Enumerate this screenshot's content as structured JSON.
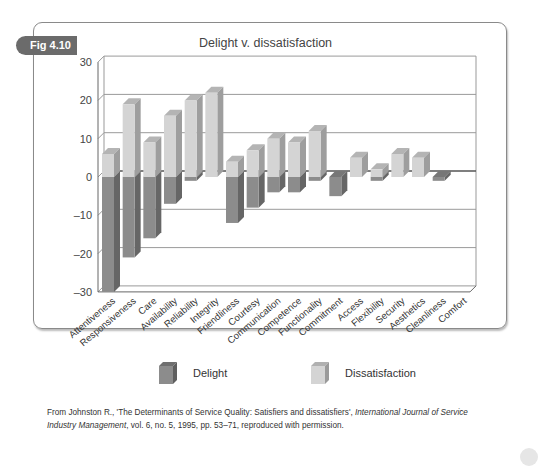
{
  "figure": {
    "tag": "Fig 4.10",
    "title": "Delight v. dissatisfaction"
  },
  "legend": {
    "delight_label": "Delight",
    "dissatisfaction_label": "Dissatisfaction"
  },
  "colors": {
    "delight": "#8c8c8c",
    "dissatisfaction": "#d4d4d4",
    "gridline": "#9a9a9a"
  },
  "source": {
    "prefix": "From Johnston R., 'The Determinants of Service Quality: Satisfiers and dissatisfiers', ",
    "journal": "International Journal of Service Industry Management",
    "suffix": ", vol. 6, no. 5, 1995, pp. 53–71, reproduced with permission."
  },
  "chart_data": {
    "type": "bar",
    "title": "Delight v. dissatisfaction",
    "xlabel": "",
    "ylabel": "",
    "ylim": [
      -30,
      30
    ],
    "yticks": [
      30,
      20,
      10,
      0,
      -10,
      -20,
      -30
    ],
    "ytick_labels": [
      "30",
      "20",
      "10",
      "0",
      "–10",
      "–20",
      "–30"
    ],
    "grid": true,
    "three_d": true,
    "legend_position": "bottom",
    "categories": [
      "Attentiveness",
      "Responsiveness",
      "Care",
      "Availability",
      "Reliability",
      "Integrity",
      "Friendliness",
      "Courtesy",
      "Communication",
      "Competence",
      "Functionality",
      "Commitment",
      "Access",
      "Flexibility",
      "Security",
      "Aesthetics",
      "Cleanliness",
      "Comfort"
    ],
    "series": [
      {
        "name": "Delight",
        "values": [
          -30,
          -21,
          -16,
          -7,
          -1,
          0,
          -12,
          -8,
          -4,
          -4,
          -1,
          -5,
          0,
          -1,
          0,
          0,
          -1,
          0
        ]
      },
      {
        "name": "Dissatisfaction",
        "values": [
          6,
          19,
          9,
          16,
          20,
          22,
          4,
          7,
          10,
          9,
          12,
          0,
          5,
          2,
          6,
          5,
          0,
          0
        ]
      }
    ]
  }
}
